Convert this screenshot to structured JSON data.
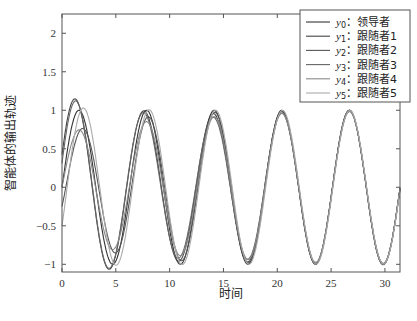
{
  "chart_data": {
    "type": "line",
    "title": "",
    "xlabel": "时间",
    "ylabel": "智能体的输出轨迹",
    "xlim": [
      0,
      31.4
    ],
    "ylim": [
      -1.1,
      2.25
    ],
    "xticks": [
      0,
      5,
      10,
      15,
      20,
      25,
      30
    ],
    "yticks": [
      -1,
      -0.5,
      0,
      0.5,
      1,
      1.5,
      2
    ],
    "ytick_labels": [
      "-1",
      "-0.5",
      "0",
      "0.5",
      "1",
      "1.5",
      "2"
    ],
    "grid": false,
    "legend_position": "upper right",
    "series": [
      {
        "name": "y0：领导者",
        "sub": "0",
        "label": "领导者",
        "color": "#333333",
        "init": 0.0,
        "amp": 0.0,
        "phase": 0.0,
        "decay": 0.0
      },
      {
        "name": "y1：跟随者1",
        "sub": "1",
        "label": "跟随者1",
        "color": "#444444",
        "init": 0.42,
        "amp": 0.9,
        "phase": 0.9,
        "decay": 0.13
      },
      {
        "name": "y2：跟随者2",
        "sub": "2",
        "label": "跟随者2",
        "color": "#555555",
        "init": -0.25,
        "amp": 0.75,
        "phase": -0.4,
        "decay": 0.12
      },
      {
        "name": "y3：跟随者3",
        "sub": "3",
        "label": "跟随者3",
        "color": "#666666",
        "init": 0.31,
        "amp": 0.85,
        "phase": 1.3,
        "decay": 0.1
      },
      {
        "name": "y4：跟随者4",
        "sub": "4",
        "label": "跟随者4",
        "color": "#888888",
        "init": 0.0,
        "amp": 0.65,
        "phase": 0.2,
        "decay": 0.11
      },
      {
        "name": "y5：跟随者5",
        "sub": "5",
        "label": "跟随者5",
        "color": "#aaaaaa",
        "init": -0.5,
        "amp": 0.95,
        "phase": -0.1,
        "decay": 0.1
      }
    ]
  },
  "legend": {
    "entries": [
      {
        "var": "y",
        "sub": "0",
        "text": "：领导者"
      },
      {
        "var": "y",
        "sub": "1",
        "text": "：跟随者1"
      },
      {
        "var": "y",
        "sub": "2",
        "text": "：跟随者2"
      },
      {
        "var": "y",
        "sub": "3",
        "text": "：跟随者3"
      },
      {
        "var": "y",
        "sub": "4",
        "text": "：跟随者4"
      },
      {
        "var": "y",
        "sub": "5",
        "text": "：跟随者5"
      }
    ]
  }
}
